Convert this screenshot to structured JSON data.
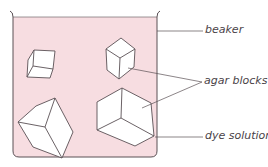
{
  "diagram": {
    "type": "labelled apparatus diagram",
    "colors": {
      "solution_fill": "#f7dde1",
      "outline": "#5a5055",
      "block_fill": "#ffffff",
      "label_text": "#4a4348"
    },
    "labels": {
      "beaker": "beaker",
      "agar_blocks": "agar blocks",
      "dye_solution": "dye solution"
    },
    "components": [
      {
        "name": "beaker",
        "label": "beaker"
      },
      {
        "name": "agar-block-small",
        "label": "agar blocks"
      },
      {
        "name": "agar-block-medium",
        "label": "agar blocks"
      },
      {
        "name": "agar-block-large-left",
        "label": "agar blocks"
      },
      {
        "name": "agar-block-large-right",
        "label": "agar blocks"
      },
      {
        "name": "dye-solution",
        "label": "dye solution"
      }
    ]
  }
}
